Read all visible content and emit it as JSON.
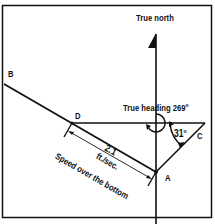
{
  "diagram": {
    "title_label": "True north",
    "heading_label": "True heading 269",
    "heading_degree_symbol": "o",
    "angle_label": "31",
    "angle_degree_symbol": "o",
    "points": {
      "A": "A",
      "B": "B",
      "C": "C",
      "D": "D"
    },
    "measure_value": "2.1",
    "measure_unit": "ft./sec.",
    "measure_caption": "Speed over the bottom",
    "colors": {
      "ink": "#111111",
      "background": "#ffffff"
    }
  }
}
